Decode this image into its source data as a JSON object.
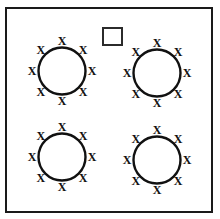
{
  "figure": {
    "canvas": {
      "width": 220,
      "height": 219,
      "background": "#ffffff"
    },
    "frame": {
      "name": "outer-border",
      "x": 6,
      "y": 8,
      "width": 206,
      "height": 204,
      "stroke": "#1a1a1a",
      "stroke_width": 2,
      "fill": "#ffffff"
    },
    "square_marker": {
      "name": "small-square",
      "label": "",
      "x": 103,
      "y": 28,
      "width": 19,
      "height": 17,
      "stroke": "#2b2b2b",
      "stroke_width": 2,
      "fill": "#ffffff"
    },
    "x_glyph": "X",
    "x_count_per_circle": 8,
    "x_angles_deg": [
      270,
      315,
      0,
      45,
      90,
      135,
      180,
      225
    ],
    "x_orbit_radius": 30,
    "circles": [
      {
        "name": "circle-top-left",
        "label": "",
        "cx": 62,
        "cy": 71,
        "r": 23.5,
        "stroke": "#111111",
        "stroke_width": 2.4,
        "fill": "#ffffff",
        "x_count": 8
      },
      {
        "name": "circle-top-right",
        "label": "",
        "cx": 157,
        "cy": 73,
        "r": 23.5,
        "stroke": "#111111",
        "stroke_width": 2.4,
        "fill": "#ffffff",
        "x_count": 8
      },
      {
        "name": "circle-bottom-left",
        "label": "",
        "cx": 62,
        "cy": 157,
        "r": 23.5,
        "stroke": "#111111",
        "stroke_width": 2.4,
        "fill": "#ffffff",
        "x_count": 8
      },
      {
        "name": "circle-bottom-right",
        "label": "",
        "cx": 157,
        "cy": 160,
        "r": 23.5,
        "stroke": "#111111",
        "stroke_width": 2.4,
        "fill": "#ffffff",
        "x_count": 8
      }
    ]
  }
}
